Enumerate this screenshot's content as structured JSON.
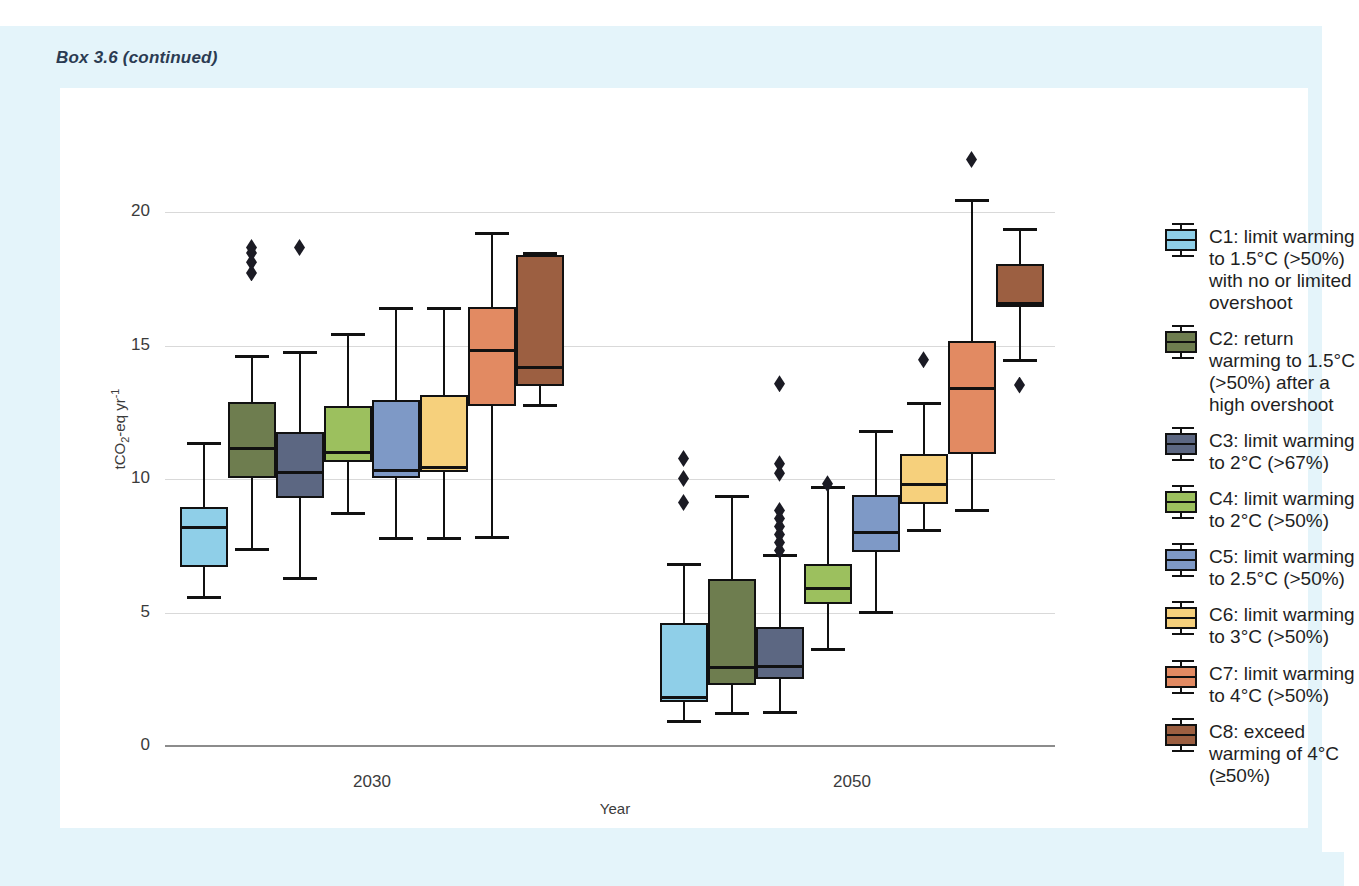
{
  "box_title": "Box 3.6 (continued)",
  "chart_data": {
    "type": "box",
    "title": "",
    "xlabel": "Year",
    "ylabel": "tCO2-eq yr-1",
    "ylabel_parts": {
      "prefix": "tCO",
      "sub": "2",
      "mid": "-eq yr",
      "sup": "-1"
    },
    "ylim": [
      0,
      22
    ],
    "yticks": [
      0,
      5,
      10,
      15,
      20
    ],
    "grid": true,
    "legend_position": "right",
    "categories": [
      "2030",
      "2050"
    ],
    "series": [
      {
        "name": "C1",
        "legend": "C1: limit warming\nto 1.5°C (>50%)\nwith no or limited\novershoot",
        "color": "#8fcfe8",
        "boxes": [
          {
            "year": "2030",
            "whisker_low": 5.5,
            "q1": 6.7,
            "median": 8.2,
            "q3": 8.95,
            "whisker_high": 11.4,
            "outliers": []
          },
          {
            "year": "2050",
            "whisker_low": 0.85,
            "q1": 1.65,
            "median": 1.85,
            "q3": 4.6,
            "whisker_high": 6.85,
            "outliers": [
              9.1,
              10.0,
              10.75
            ]
          }
        ]
      },
      {
        "name": "C2",
        "legend": "C2: return\nwarming to 1.5°C\n(>50%) after a\nhigh overshoot",
        "color": "#6e7d4f",
        "boxes": [
          {
            "year": "2030",
            "whisker_low": 7.3,
            "q1": 10.05,
            "median": 11.15,
            "q3": 12.9,
            "whisker_high": 14.65,
            "outliers": [
              17.7,
              18.1,
              18.45,
              18.65
            ]
          },
          {
            "year": "2050",
            "whisker_low": 1.15,
            "q1": 2.3,
            "median": 2.95,
            "q3": 6.25,
            "whisker_high": 9.4,
            "outliers": []
          }
        ]
      },
      {
        "name": "C3",
        "legend": "C3: limit warming\nto 2°C (>67%)",
        "color": "#5c6782",
        "boxes": [
          {
            "year": "2030",
            "whisker_low": 6.2,
            "q1": 9.3,
            "median": 10.25,
            "q3": 11.75,
            "whisker_high": 14.8,
            "outliers": [
              18.65
            ]
          },
          {
            "year": "2050",
            "whisker_low": 1.2,
            "q1": 2.5,
            "median": 3.0,
            "q3": 4.45,
            "whisker_high": 7.2,
            "outliers": [
              7.3,
              7.6,
              7.9,
              8.2,
              8.5,
              8.8,
              10.2,
              10.55,
              13.55
            ]
          }
        ]
      },
      {
        "name": "C4",
        "legend": "C4: limit warming\nto 2°C (>50%)",
        "color": "#9cc05e",
        "boxes": [
          {
            "year": "2030",
            "whisker_low": 8.65,
            "q1": 10.65,
            "median": 11.0,
            "q3": 12.75,
            "whisker_high": 15.45,
            "outliers": []
          },
          {
            "year": "2050",
            "whisker_low": 3.55,
            "q1": 5.3,
            "median": 5.9,
            "q3": 6.8,
            "whisker_high": 9.75,
            "outliers": [
              9.8
            ]
          }
        ]
      },
      {
        "name": "C5",
        "legend": "C5: limit warming\nto 2.5°C (>50%)",
        "color": "#7e99c6",
        "boxes": [
          {
            "year": "2030",
            "whisker_low": 7.7,
            "q1": 10.05,
            "median": 10.35,
            "q3": 12.95,
            "whisker_high": 16.45,
            "outliers": []
          },
          {
            "year": "2050",
            "whisker_low": 4.95,
            "q1": 7.25,
            "median": 8.0,
            "q3": 9.4,
            "whisker_high": 11.85,
            "outliers": []
          }
        ]
      },
      {
        "name": "C6",
        "legend": "C6: limit warming\nto 3°C (>50%)",
        "color": "#f6d07c",
        "boxes": [
          {
            "year": "2030",
            "whisker_low": 7.7,
            "q1": 10.25,
            "median": 10.45,
            "q3": 13.15,
            "whisker_high": 16.45,
            "outliers": []
          },
          {
            "year": "2050",
            "whisker_low": 8.0,
            "q1": 9.05,
            "median": 9.8,
            "q3": 10.95,
            "whisker_high": 12.9,
            "outliers": [
              14.45
            ]
          }
        ]
      },
      {
        "name": "C7",
        "legend": "C7: limit warming\nto 4°C (>50%)",
        "color": "#e28a62",
        "boxes": [
          {
            "year": "2030",
            "whisker_low": 7.75,
            "q1": 12.75,
            "median": 14.85,
            "q3": 16.45,
            "whisker_high": 19.25,
            "outliers": []
          },
          {
            "year": "2050",
            "whisker_low": 8.75,
            "q1": 10.95,
            "median": 13.4,
            "q3": 15.15,
            "whisker_high": 20.5,
            "outliers": [
              21.95
            ]
          }
        ]
      },
      {
        "name": "C8",
        "legend": "C8: exceed\nwarming of 4°C\n(≥50%)",
        "color": "#9c5f41",
        "boxes": [
          {
            "year": "2030",
            "whisker_low": 12.7,
            "q1": 13.5,
            "median": 14.2,
            "q3": 18.4,
            "whisker_high": 18.5,
            "outliers": []
          },
          {
            "year": "2050",
            "whisker_low": 14.4,
            "q1": 16.45,
            "median": 16.6,
            "q3": 18.05,
            "whisker_high": 19.4,
            "outliers": [
              13.5
            ]
          }
        ]
      }
    ]
  }
}
